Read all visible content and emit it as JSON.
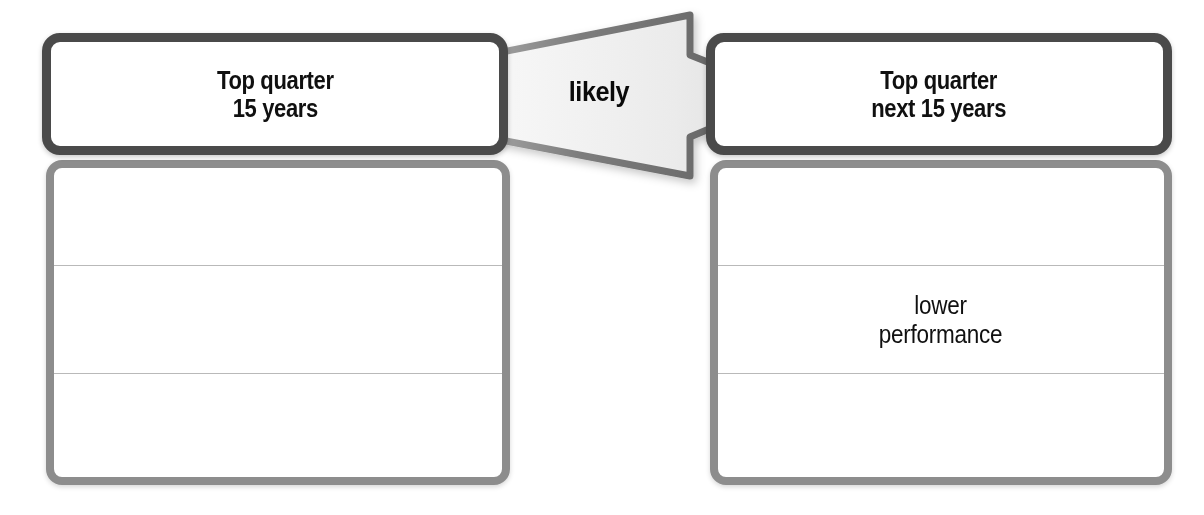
{
  "diagram": {
    "colors": {
      "card_border_dark": "#4a4a4a",
      "card_border_light": "#8d8d8d",
      "card_fill": "#ffffff",
      "divider": "#b9b9b9",
      "arrow_outline": "#6b6b6b",
      "arrow_fill_light": "#f2f2f2",
      "arrow_fill_mid": "#dedede",
      "text": "#101010",
      "background": "#ffffff"
    },
    "top_left_card": {
      "label": "Top quarter\n15 years"
    },
    "top_right_card": {
      "label": "Top quarter\nnext 15 years"
    },
    "bottom_left_card": {
      "bands": [
        {
          "label": ""
        },
        {
          "label": ""
        },
        {
          "label": ""
        }
      ]
    },
    "bottom_right_card": {
      "bands": [
        {
          "label": ""
        },
        {
          "label": "lower\nperformance"
        },
        {
          "label": ""
        }
      ]
    },
    "arrow": {
      "label": "likely",
      "direction": "right",
      "icon": "block-arrow-right-icon"
    }
  }
}
